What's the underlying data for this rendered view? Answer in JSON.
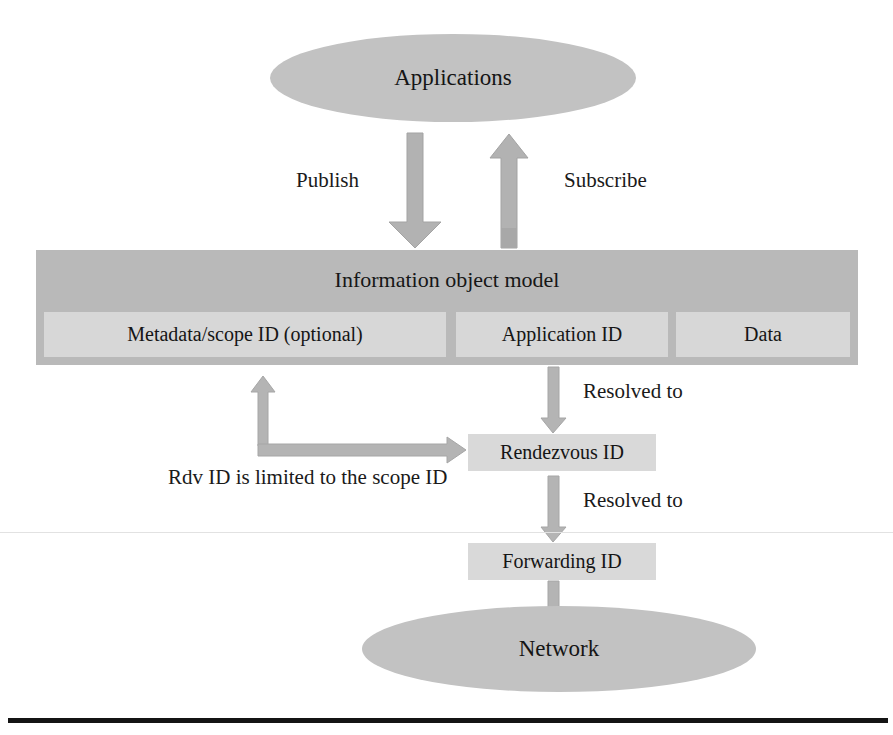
{
  "figure": {
    "nodes": {
      "applications": "Applications",
      "information_object_model": "Information object model",
      "metadata_scope_id": "Metadata/scope ID (optional)",
      "application_id": "Application ID",
      "data": "Data",
      "rendezvous_id": "Rendezvous ID",
      "forwarding_id": "Forwarding ID",
      "network": "Network"
    },
    "edge_labels": {
      "publish": "Publish",
      "subscribe": "Subscribe",
      "resolved_to_rendezvous": "Resolved to",
      "resolved_to_forwarding": "Resolved to",
      "rdv_scope_constraint": "Rdv ID is limited to the scope ID"
    },
    "colors": {
      "ellipse_fill": "#c2c2c2",
      "bar_fill": "#b9b9b9",
      "slot_fill": "#d7d7d7",
      "id_box_fill": "#d9d9d9",
      "arrow_fill": "#b2b2b2",
      "arrow_stroke": "#9a9a9a",
      "text": "#1a1a1a",
      "rule": "#141414",
      "background": "#ffffff"
    }
  }
}
